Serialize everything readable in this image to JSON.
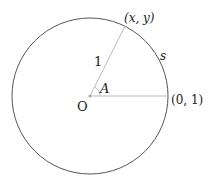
{
  "diagram": {
    "type": "unit-circle",
    "labels": {
      "origin": "O",
      "point": "(x, y)",
      "radius": "1",
      "angle": "A",
      "arc": "s",
      "axis_point": "(0, 1)"
    },
    "colors": {
      "circle": "#555555",
      "lines": "#bbbbbb",
      "text": "#222222",
      "origin_dot": "#aaaaaa"
    }
  }
}
